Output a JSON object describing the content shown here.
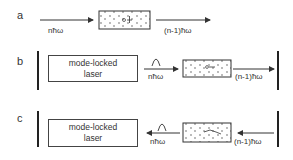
{
  "panels": [
    {
      "label": "a",
      "input_photon": "nħω",
      "output_photon": "(n-1)ħω"
    },
    {
      "label": "b",
      "laser_line1": "mode-locked",
      "laser_line2": "laser",
      "input_photon": "nħω",
      "output_photon": "(n-1)ħω",
      "direction": "forward"
    },
    {
      "label": "c",
      "laser_line1": "mode-locked",
      "laser_line2": "laser",
      "input_photon": "nħω",
      "output_photon": "(n-1)ħω",
      "direction": "backward"
    }
  ],
  "colors": {
    "line": "#333333",
    "background": "#ffffff"
  }
}
